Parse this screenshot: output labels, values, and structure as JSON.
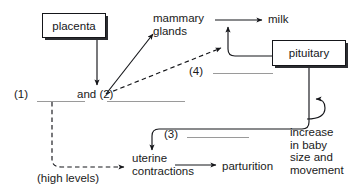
{
  "diagram": {
    "colors": {
      "line": "#15161a",
      "blank_rule": "#9a9a9a",
      "box_border": "#15161a",
      "box_shadow": "#2b2d31",
      "text": "#1a1a1a",
      "background": "#ffffff"
    },
    "boxes": [
      {
        "id": "placenta",
        "label": "placenta"
      },
      {
        "id": "pituitary",
        "label": "pituitary"
      }
    ],
    "labels": {
      "mammary_glands": "mammary\nglands",
      "milk": "milk",
      "blank_one": "(1)",
      "blank_and_two": "and (2)",
      "blank_three": "(3)",
      "blank_four": "(4)",
      "uterine_contractions": "uterine\ncontractions",
      "parturition": "parturition",
      "high_levels": "(high levels)",
      "increase_baby": "increase\nin baby\nsize and\nmovement"
    },
    "connections": [
      {
        "id": "placenta-to-and2",
        "from": "placenta",
        "to": "and (2)",
        "style": "solid",
        "arrow": true
      },
      {
        "id": "and2-to-mammary",
        "from": "and (2)",
        "to": "mammary glands",
        "style": "solid",
        "arrow": true
      },
      {
        "id": "and2-to-pituitary-curve",
        "from": "and (2)",
        "to": "pituitary output curve",
        "style": "dashed",
        "arrow": true
      },
      {
        "id": "mammary-to-milk",
        "from": "mammary glands",
        "to": "milk",
        "style": "solid",
        "arrow": true
      },
      {
        "id": "pituitary-to-milk-curve",
        "from": "pituitary",
        "to": "milk arrow",
        "style": "solid",
        "arrow": true
      },
      {
        "id": "four-line-to-pituitary",
        "from": "(4)",
        "to": "pituitary",
        "style": "solid",
        "arrow": false
      },
      {
        "id": "pituitary-to-uterine",
        "from": "pituitary",
        "to": "uterine contractions",
        "style": "solid",
        "arrow": true
      },
      {
        "id": "uterine-to-parturition",
        "from": "uterine contractions",
        "to": "parturition",
        "style": "solid",
        "arrow": true
      },
      {
        "id": "one-to-uterine",
        "from": "(1)",
        "to": "uterine contractions",
        "style": "dashed",
        "arrow": true,
        "label": "(high levels)"
      },
      {
        "id": "baby-to-pituitary-line",
        "from": "increase in baby size and movement",
        "to": "pituitary descending line",
        "style": "solid",
        "arrow": true
      }
    ]
  }
}
